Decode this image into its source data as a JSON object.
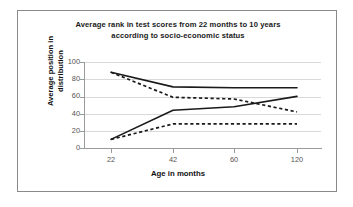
{
  "chart_data": {
    "type": "line",
    "title": "Average rank in test scores from 22 months to 10 years according to socio-economic status",
    "title_line_1": "Average rank in test scores from 22 months to 10 years",
    "title_line_2": "according to socio-economic status",
    "xlabel": "Age in months",
    "ylabel": "Average position in distribution",
    "ylabel_line_1": "Average position in",
    "ylabel_line_2": "distribution",
    "x": [
      22,
      42,
      60,
      120
    ],
    "categories": [
      "22",
      "42",
      "60",
      "120"
    ],
    "xtick_labels": [
      "22",
      "42",
      "60",
      "120"
    ],
    "ytick_labels": [
      "0",
      "20",
      "40",
      "60",
      "80",
      "100"
    ],
    "yticks": [
      0,
      20,
      40,
      60,
      80,
      100
    ],
    "ylim": [
      0,
      100
    ],
    "grid": "horizontal",
    "legend": "none",
    "line_color": "#1a1a1a",
    "grid_color": "#d9d9d9",
    "axis_color": "#9a9a9a",
    "series": [
      {
        "name": "high-score-high-ses",
        "style": "solid",
        "values": [
          88,
          71,
          70,
          70
        ]
      },
      {
        "name": "high-score-low-ses",
        "style": "dashed",
        "values": [
          88,
          59,
          57,
          42
        ]
      },
      {
        "name": "low-score-high-ses",
        "style": "solid",
        "values": [
          10,
          44,
          48,
          60
        ]
      },
      {
        "name": "low-score-low-ses",
        "style": "dashed",
        "values": [
          10,
          28,
          28,
          28
        ]
      }
    ]
  }
}
